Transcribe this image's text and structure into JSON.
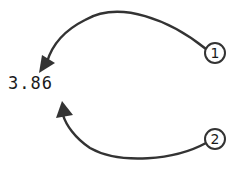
{
  "diagram": {
    "value": "3.86",
    "markers": [
      {
        "id": "1",
        "label": "1"
      },
      {
        "id": "2",
        "label": "2"
      }
    ],
    "colors": {
      "stroke": "#333333",
      "text": "#1a1a1a",
      "background": "#ffffff"
    }
  }
}
